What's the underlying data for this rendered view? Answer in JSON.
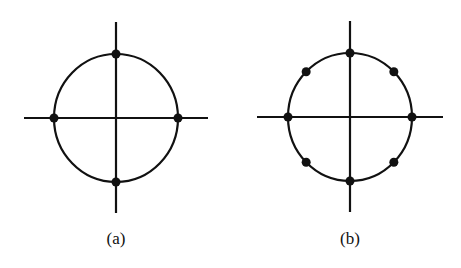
{
  "figures": [
    {
      "id": "a",
      "label": "(a)",
      "points": 4,
      "center": [
        116,
        118
      ],
      "radius": 62,
      "axis_h": [
        24,
        208
      ],
      "axis_v": [
        22,
        213
      ]
    },
    {
      "id": "b",
      "label": "(b)",
      "points": 8,
      "center": [
        350,
        117
      ],
      "radius": 62,
      "axis_h": [
        257,
        443
      ],
      "axis_v": [
        21,
        212
      ]
    }
  ],
  "colors": {
    "stroke": "#111111",
    "background": "#ffffff"
  }
}
